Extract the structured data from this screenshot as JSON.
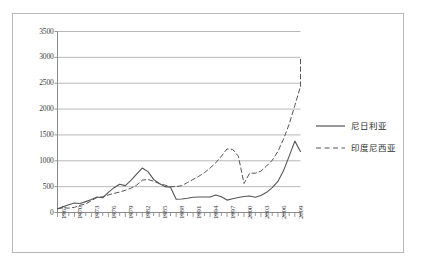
{
  "chart_data": {
    "type": "line",
    "title": "",
    "subtitle": "",
    "xlabel": "",
    "ylabel": "",
    "ylim": [
      0,
      3500
    ],
    "ytick_step": 500,
    "yticks": [
      "0",
      "500",
      "1000",
      "1500",
      "2000",
      "2500",
      "3000",
      "3500"
    ],
    "grid": true,
    "legend_position": "right",
    "x": [
      1967,
      1968,
      1969,
      1970,
      1971,
      1972,
      1973,
      1974,
      1975,
      1976,
      1977,
      1978,
      1979,
      1980,
      1981,
      1982,
      1983,
      1984,
      1985,
      1986,
      1987,
      1988,
      1989,
      1990,
      1991,
      1992,
      1993,
      1994,
      1995,
      1996,
      1997,
      1998,
      1999,
      2000,
      2001,
      2002,
      2003,
      2004,
      2005,
      2006,
      2007,
      2008,
      2009,
      2010
    ],
    "xtick_labels": [
      "1967",
      "1970",
      "1973",
      "1976",
      "1979",
      "1982",
      "1985",
      "1988",
      "1991",
      "1994",
      "1997",
      "2000",
      "2003",
      "2006",
      "2009"
    ],
    "xtick_values": [
      1967,
      1970,
      1973,
      1976,
      1979,
      1982,
      1985,
      1988,
      1991,
      1994,
      1997,
      2000,
      2003,
      2006,
      2009
    ],
    "series": [
      {
        "name": "尼日利亚",
        "style": "solid",
        "color": "#555555",
        "values": [
          70,
          110,
          150,
          185,
          175,
          210,
          250,
          300,
          285,
          390,
          480,
          545,
          520,
          620,
          740,
          860,
          790,
          640,
          560,
          500,
          490,
          255,
          260,
          275,
          295,
          300,
          300,
          300,
          340,
          305,
          240,
          265,
          290,
          310,
          320,
          295,
          330,
          390,
          480,
          600,
          810,
          1090,
          1380,
          1180
        ]
      },
      {
        "name": "印度尼西亚",
        "style": "dashed",
        "color": "#555555",
        "values": [
          75,
          90,
          85,
          100,
          140,
          165,
          230,
          290,
          305,
          340,
          370,
          395,
          430,
          470,
          530,
          625,
          640,
          605,
          560,
          530,
          500,
          500,
          520,
          580,
          640,
          700,
          770,
          860,
          960,
          1090,
          1230,
          1220,
          1090,
          560,
          760,
          760,
          800,
          900,
          1010,
          1180,
          1420,
          1710,
          2070,
          2440
        ]
      }
    ],
    "annotations": [
      {
        "type": "partial-dash-tail",
        "note": "dashed series continues upward to ~3000 at far right edge"
      }
    ]
  },
  "legend": {
    "entries": [
      {
        "label": "尼日利亚",
        "style": "solid"
      },
      {
        "label": "印度尼西亚",
        "style": "dashed"
      }
    ]
  }
}
